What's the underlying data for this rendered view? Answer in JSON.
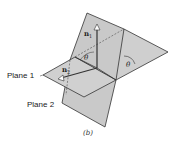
{
  "figure": {
    "caption": "(b)",
    "labels": {
      "plane1": "Plane 1",
      "plane2": "Plane 2",
      "normal1": "n",
      "normal1_sub": "1",
      "normal2": "n",
      "normal2_sub": "2",
      "angle_inner": "θ",
      "angle_outer": "θ"
    },
    "colors": {
      "plane_fill": "#c8c8c8",
      "plane_fill_light": "#d4d4d4",
      "edge": "#333333"
    }
  }
}
